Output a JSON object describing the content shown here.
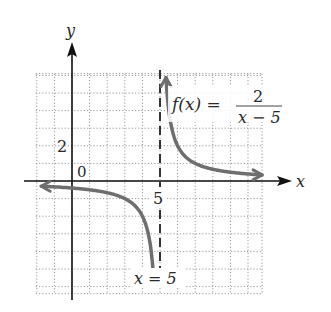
{
  "chart_data": {
    "type": "line",
    "title": "",
    "function_label": "f(x) = 2/(x − 5)",
    "function": {
      "numerator": "2",
      "denominator": "x − 5"
    },
    "xlabel": "x",
    "ylabel": "y",
    "xlim": [
      -2,
      11
    ],
    "ylim": [
      -6,
      6
    ],
    "grid": true,
    "grid_style": "dotted",
    "grid_step": 1,
    "tick_labels": {
      "origin": "0",
      "x": [
        "5"
      ],
      "y": [
        "2"
      ]
    },
    "asymptotes": [
      {
        "type": "vertical",
        "x": 5,
        "label": "x = 5",
        "style": "dashed"
      },
      {
        "type": "horizontal",
        "y": 0,
        "note": "x-axis"
      }
    ],
    "series": [
      {
        "name": "left branch",
        "x": [
          -1.8,
          -1,
          0,
          1,
          2,
          3,
          3.5,
          4,
          4.3,
          4.55,
          4.65
        ],
        "values": [
          -0.29,
          -0.33,
          -0.4,
          -0.5,
          -0.67,
          -1,
          -1.33,
          -2,
          -2.86,
          -4.44,
          -5.7
        ],
        "arrows": [
          "left",
          "down"
        ]
      },
      {
        "name": "right branch",
        "x": [
          5.35,
          5.45,
          5.7,
          6,
          6.5,
          7,
          8,
          9,
          10,
          10.8
        ],
        "values": [
          5.7,
          4.44,
          2.86,
          2,
          1.33,
          1,
          0.67,
          0.5,
          0.4,
          0.34
        ],
        "arrows": [
          "up",
          "right"
        ]
      }
    ],
    "colors": {
      "curve": "#6e6e6e",
      "axes": "#111111",
      "grid": "#9a9a9a",
      "asymptote": "#333333"
    }
  },
  "labels": {
    "y_axis": "y",
    "x_axis": "x",
    "origin": "0",
    "tick_y2": "2",
    "tick_x5": "5",
    "func_lhs": "f(x) =",
    "func_num": "2",
    "func_den": "x − 5",
    "asymptote": "x = 5"
  }
}
